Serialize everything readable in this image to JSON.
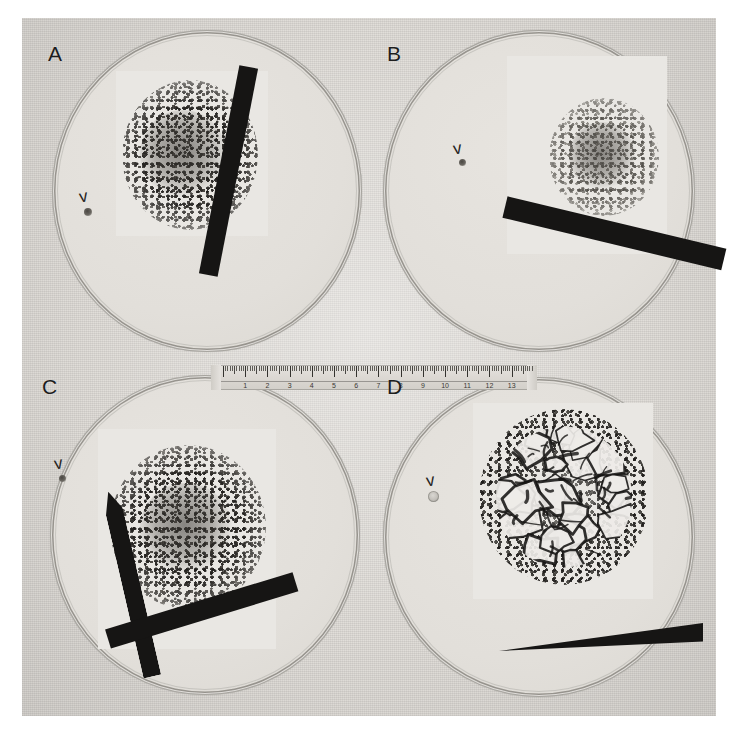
{
  "figure": {
    "type": "photographic-plate",
    "layout": "2x2 grid of panels labelled A, B, C, D",
    "background_color": "#dedbd6",
    "ink_color": "#161514",
    "page_color": "#ffffff"
  },
  "panels": [
    {
      "id": "a",
      "label": "A",
      "marker_glyph": "v",
      "marker_name": "arrowhead-marker",
      "marker_points_to": "isolated single colony",
      "colony_appearance": "dense dark granular mass of small discrete colonies",
      "bar_count": 1,
      "bar_orientation": "near-vertical, tilted right"
    },
    {
      "id": "b",
      "label": "B",
      "marker_glyph": "v",
      "marker_name": "arrowhead-marker",
      "marker_points_to": "isolated single colony",
      "colony_appearance": "compact pale grey granular mass, smaller than A",
      "bar_count": 1,
      "bar_orientation": "near-horizontal, sloping down to the right"
    },
    {
      "id": "c",
      "label": "C",
      "marker_glyph": "v",
      "marker_name": "arrowhead-marker",
      "marker_points_to": "isolated single colony",
      "colony_appearance": "broad dark granular mass, largest speckled field",
      "bar_count": 2,
      "bar_orientation": "two bars crossing in a cross/X shape, lower left"
    },
    {
      "id": "d",
      "label": "D",
      "marker_glyph": "v",
      "marker_name": "arrowhead-marker",
      "marker_points_to": "isolated single colony",
      "colony_appearance": "large confluent pale plaques with dark interstitial margins, surrounded by fine dark speckle",
      "bar_count": 1,
      "bar_orientation": "wedge-shaped bar, sloping up to the right"
    }
  ],
  "ruler": {
    "name": "scale-ruler",
    "unit": "cm",
    "numbers": [
      "1",
      "2",
      "3",
      "4",
      "5",
      "6",
      "7",
      "8",
      "9",
      "10",
      "11",
      "12",
      "13"
    ],
    "minor_divisions_per_unit": 10
  }
}
